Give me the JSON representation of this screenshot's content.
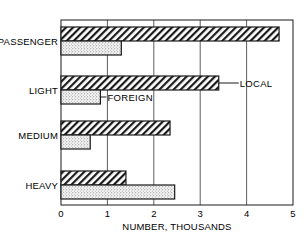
{
  "chart_data": {
    "type": "bar",
    "orientation": "horizontal",
    "title": "",
    "xlabel": "NUMBER, THOUSANDS",
    "ylabel": "",
    "categories": [
      "PASSENGER",
      "LIGHT",
      "MEDIUM",
      "HEAVY"
    ],
    "series": [
      {
        "name": "LOCAL",
        "pattern": "diagonal-hatch",
        "values": [
          4.7,
          3.4,
          2.35,
          1.4
        ]
      },
      {
        "name": "FOREIGN",
        "pattern": "stipple",
        "values": [
          1.3,
          0.85,
          0.63,
          2.45
        ]
      }
    ],
    "xlim": [
      0,
      5
    ],
    "xticks": [
      "0",
      "1",
      "2",
      "3",
      "4",
      "5"
    ],
    "grid": "vertical gridlines at each integer",
    "legend": "inline annotations with leader lines (LOCAL on LIGHT local bar, FOREIGN on LIGHT foreign bar)",
    "annotations": [
      {
        "text": "LOCAL",
        "category": "LIGHT",
        "series": "LOCAL"
      },
      {
        "text": "FOREIGN",
        "category": "LIGHT",
        "series": "FOREIGN"
      }
    ]
  }
}
